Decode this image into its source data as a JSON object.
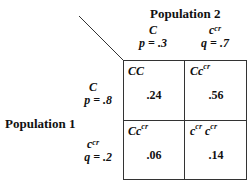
{
  "title_top": "Population 2",
  "title_left": "Population 1",
  "columns": [
    {
      "allele": "C",
      "allele_sup": "",
      "freq": "p = .3"
    },
    {
      "allele": "c",
      "allele_sup": "cr",
      "freq": "q = .7"
    }
  ],
  "rows": [
    {
      "allele": "C",
      "allele_sup": "",
      "freq": "p = .8"
    },
    {
      "allele": "c",
      "allele_sup": "cr",
      "freq": "q = .2"
    }
  ],
  "cells": [
    [
      {
        "genotype": "CC",
        "value": ".24"
      },
      {
        "genotype": "Cc^cr",
        "value": ".56"
      }
    ],
    [
      {
        "genotype": "Cc^cr",
        "value": ".06"
      },
      {
        "genotype": "c^cr c^cr",
        "value": ".14"
      }
    ]
  ],
  "cell_labels": {
    "c00_main": "CC",
    "c01_main": "Cc",
    "c01_sup": "cr",
    "c10_main": "Cc",
    "c10_sup": "cr",
    "c11_a": "c",
    "c11_sup1": "cr",
    "c11_b": "c",
    "c11_sup2": "cr"
  }
}
